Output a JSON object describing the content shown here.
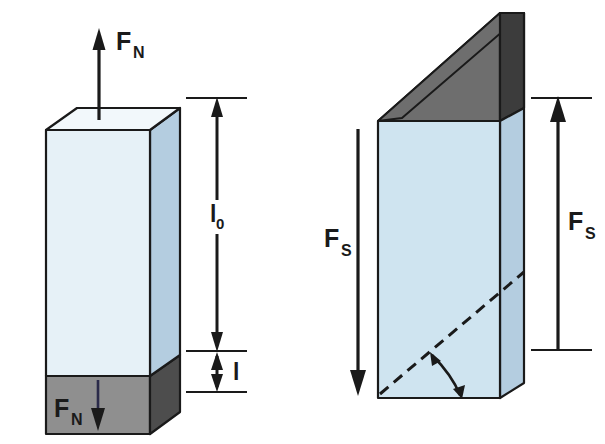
{
  "figure": {
    "background_color": "#ffffff",
    "outline_color": "#1a1a1a"
  },
  "colors": {
    "face_front_pale": "#e6f1f7",
    "face_front_blue": "#cfe4f0",
    "face_side_blue": "#b4cde0",
    "face_top_white": "#f2f8fb",
    "base_gray": "#8f8f8f",
    "base_gray_dark": "#4d4d4d",
    "slant_gray": "#6e6e6e",
    "slant_gray_dark": "#3c3c3c",
    "stroke": "#1a1a1a",
    "arrow_navy": "#2b2b4a"
  },
  "left_panel": {
    "name": "normal-force-diagram",
    "force_top": {
      "symbol": "F",
      "subscript": "N",
      "direction": "up"
    },
    "force_bottom": {
      "symbol": "F",
      "subscript": "N",
      "direction": "down"
    },
    "dimensions": [
      {
        "symbol": "l",
        "subscript": "0",
        "description": "original length",
        "direction": "double"
      },
      {
        "symbol": "l",
        "subscript": "",
        "description": "extension",
        "direction": "double"
      }
    ]
  },
  "right_panel": {
    "name": "shear-force-diagram",
    "force_left": {
      "symbol": "F",
      "subscript": "S",
      "direction": "down"
    },
    "force_right": {
      "symbol": "F",
      "subscript": "S",
      "direction": "up"
    },
    "shear_angle": {
      "marker": "arc",
      "description": "shear angle between dashed reference line and base edge"
    },
    "reference_line": {
      "style": "dashed",
      "description": "undeformed diagonal reference"
    }
  }
}
